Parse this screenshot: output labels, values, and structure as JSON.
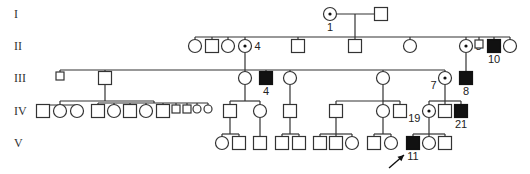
{
  "generations": [
    "I",
    "II",
    "III",
    "IV",
    "V"
  ],
  "gen_y": [
    14,
    46,
    78,
    111,
    143
  ],
  "size": 13,
  "small_size": 8,
  "individuals": [
    {
      "id": "I-1",
      "gen": 0,
      "x": 330,
      "sex": "F",
      "status": "carrier",
      "label": "1",
      "label_pos": "below"
    },
    {
      "id": "I-2",
      "gen": 0,
      "x": 381,
      "sex": "M",
      "status": "normal"
    },
    {
      "id": "II-a",
      "gen": 1,
      "x": 195,
      "sex": "F",
      "status": "normal"
    },
    {
      "id": "II-b",
      "gen": 1,
      "x": 212,
      "sex": "M",
      "status": "normal"
    },
    {
      "id": "II-c",
      "gen": 1,
      "x": 228,
      "sex": "F",
      "status": "normal"
    },
    {
      "id": "II-4",
      "gen": 1,
      "x": 245,
      "sex": "F",
      "status": "carrier",
      "label": "4",
      "label_pos": "right"
    },
    {
      "id": "II-e",
      "gen": 1,
      "x": 298,
      "sex": "M",
      "status": "normal"
    },
    {
      "id": "II-f",
      "gen": 1,
      "x": 355,
      "sex": "M",
      "status": "normal"
    },
    {
      "id": "II-g",
      "gen": 1,
      "x": 410,
      "sex": "F",
      "status": "normal"
    },
    {
      "id": "II-8",
      "gen": 1,
      "x": 466,
      "sex": "F",
      "status": "carrier",
      "label": "8",
      "label_pos": "right"
    },
    {
      "id": "II-i",
      "gen": 1,
      "x": 479,
      "sex": "M",
      "status": "normal",
      "small": true
    },
    {
      "id": "II-10",
      "gen": 1,
      "x": 494,
      "sex": "M",
      "status": "affected",
      "label": "10",
      "label_pos": "below"
    },
    {
      "id": "II-k",
      "gen": 1,
      "x": 510,
      "sex": "F",
      "status": "normal"
    },
    {
      "id": "III-a",
      "gen": 2,
      "x": 60,
      "sex": "M",
      "status": "normal",
      "small": true
    },
    {
      "id": "III-b",
      "gen": 2,
      "x": 105,
      "sex": "M",
      "status": "normal"
    },
    {
      "id": "III-c",
      "gen": 2,
      "x": 245,
      "sex": "F",
      "status": "normal"
    },
    {
      "id": "III-4",
      "gen": 2,
      "x": 266,
      "sex": "M",
      "status": "affected",
      "label": "4",
      "label_pos": "below"
    },
    {
      "id": "III-e",
      "gen": 2,
      "x": 290,
      "sex": "F",
      "status": "normal"
    },
    {
      "id": "III-f",
      "gen": 2,
      "x": 383,
      "sex": "F",
      "status": "normal"
    },
    {
      "id": "III-7",
      "gen": 2,
      "x": 445,
      "sex": "F",
      "status": "carrier",
      "label": "7",
      "label_pos": "left"
    },
    {
      "id": "III-8",
      "gen": 2,
      "x": 466,
      "sex": "M",
      "status": "affected",
      "label": "8",
      "label_pos": "below"
    },
    {
      "id": "IV-1",
      "gen": 3,
      "x": 43,
      "sex": "M",
      "status": "normal"
    },
    {
      "id": "IV-2",
      "gen": 3,
      "x": 60,
      "sex": "F",
      "status": "normal"
    },
    {
      "id": "IV-3",
      "gen": 3,
      "x": 77,
      "sex": "F",
      "status": "normal"
    },
    {
      "id": "IV-4",
      "gen": 3,
      "x": 98,
      "sex": "M",
      "status": "normal"
    },
    {
      "id": "IV-5",
      "gen": 3,
      "x": 114,
      "sex": "F",
      "status": "normal"
    },
    {
      "id": "IV-6",
      "gen": 3,
      "x": 130,
      "sex": "M",
      "status": "normal"
    },
    {
      "id": "IV-7",
      "gen": 3,
      "x": 146,
      "sex": "F",
      "status": "normal"
    },
    {
      "id": "IV-8",
      "gen": 3,
      "x": 163,
      "sex": "M",
      "status": "normal"
    },
    {
      "id": "IV-9",
      "gen": 3,
      "x": 176,
      "sex": "M",
      "status": "normal",
      "small": true
    },
    {
      "id": "IV-10",
      "gen": 3,
      "x": 187,
      "sex": "M",
      "status": "normal",
      "small": true
    },
    {
      "id": "IV-11",
      "gen": 3,
      "x": 197,
      "sex": "F",
      "status": "normal",
      "small": true
    },
    {
      "id": "IV-12",
      "gen": 3,
      "x": 208,
      "sex": "F",
      "status": "normal",
      "small": true
    },
    {
      "id": "IV-13",
      "gen": 3,
      "x": 230,
      "sex": "M",
      "status": "normal"
    },
    {
      "id": "IV-14",
      "gen": 3,
      "x": 260,
      "sex": "F",
      "status": "normal"
    },
    {
      "id": "IV-15",
      "gen": 3,
      "x": 290,
      "sex": "M",
      "status": "normal"
    },
    {
      "id": "IV-16",
      "gen": 3,
      "x": 336,
      "sex": "M",
      "status": "normal"
    },
    {
      "id": "IV-17",
      "gen": 3,
      "x": 383,
      "sex": "F",
      "status": "normal"
    },
    {
      "id": "IV-18",
      "gen": 3,
      "x": 400,
      "sex": "M",
      "status": "normal"
    },
    {
      "id": "IV-19",
      "gen": 3,
      "x": 429,
      "sex": "F",
      "status": "carrier",
      "label": "19",
      "label_pos": "left"
    },
    {
      "id": "IV-20",
      "gen": 3,
      "x": 445,
      "sex": "M",
      "status": "normal"
    },
    {
      "id": "IV-21",
      "gen": 3,
      "x": 461,
      "sex": "M",
      "status": "affected",
      "label": "21",
      "label_pos": "below"
    },
    {
      "id": "V-1",
      "gen": 4,
      "x": 222,
      "sex": "F",
      "status": "normal"
    },
    {
      "id": "V-2",
      "gen": 4,
      "x": 239,
      "sex": "M",
      "status": "normal"
    },
    {
      "id": "V-3",
      "gen": 4,
      "x": 260,
      "sex": "M",
      "status": "normal"
    },
    {
      "id": "V-4",
      "gen": 4,
      "x": 282,
      "sex": "M",
      "status": "normal"
    },
    {
      "id": "V-5",
      "gen": 4,
      "x": 299,
      "sex": "M",
      "status": "normal"
    },
    {
      "id": "V-6",
      "gen": 4,
      "x": 320,
      "sex": "M",
      "status": "normal"
    },
    {
      "id": "V-7",
      "gen": 4,
      "x": 336,
      "sex": "M",
      "status": "normal"
    },
    {
      "id": "V-8",
      "gen": 4,
      "x": 352,
      "sex": "F",
      "status": "normal"
    },
    {
      "id": "V-9",
      "gen": 4,
      "x": 374,
      "sex": "M",
      "status": "normal"
    },
    {
      "id": "V-10",
      "gen": 4,
      "x": 391,
      "sex": "F",
      "status": "normal"
    },
    {
      "id": "V-11",
      "gen": 4,
      "x": 413,
      "sex": "M",
      "status": "affected",
      "label": "11",
      "label_pos": "below",
      "proband": true
    },
    {
      "id": "V-12",
      "gen": 4,
      "x": 429,
      "sex": "F",
      "status": "normal"
    },
    {
      "id": "V-13",
      "gen": 4,
      "x": 445,
      "sex": "M",
      "status": "normal"
    }
  ],
  "lines": [
    [
      337,
      14,
      374,
      14
    ],
    [
      355,
      14,
      355,
      37
    ],
    [
      195,
      37,
      510,
      37
    ],
    [
      195,
      37,
      195,
      40
    ],
    [
      212,
      37,
      212,
      40
    ],
    [
      228,
      37,
      228,
      40
    ],
    [
      245,
      37,
      245,
      40
    ],
    [
      298,
      37,
      298,
      40
    ],
    [
      355,
      37,
      355,
      40
    ],
    [
      410,
      37,
      410,
      40
    ],
    [
      466,
      37,
      466,
      40
    ],
    [
      479,
      37,
      479,
      43
    ],
    [
      494,
      37,
      494,
      40
    ],
    [
      510,
      37,
      510,
      40
    ],
    [
      245,
      53,
      245,
      70
    ],
    [
      60,
      70,
      445,
      70
    ],
    [
      60,
      70,
      60,
      74
    ],
    [
      105,
      70,
      105,
      72
    ],
    [
      245,
      70,
      245,
      72
    ],
    [
      266,
      70,
      266,
      72
    ],
    [
      290,
      70,
      290,
      72
    ],
    [
      383,
      70,
      383,
      72
    ],
    [
      445,
      70,
      445,
      72
    ],
    [
      466,
      53,
      466,
      72
    ],
    [
      105,
      85,
      105,
      101
    ],
    [
      60,
      101,
      154,
      101
    ],
    [
      60,
      101,
      60,
      105
    ],
    [
      43,
      105,
      77,
      105
    ],
    [
      43,
      105,
      43,
      105
    ],
    [
      77,
      105,
      77,
      105
    ],
    [
      154,
      101,
      154,
      103
    ],
    [
      98,
      103,
      208,
      103
    ],
    [
      98,
      103,
      98,
      105
    ],
    [
      114,
      103,
      114,
      105
    ],
    [
      130,
      103,
      130,
      105
    ],
    [
      146,
      103,
      146,
      105
    ],
    [
      163,
      103,
      163,
      105
    ],
    [
      176,
      103,
      176,
      107
    ],
    [
      187,
      103,
      187,
      107
    ],
    [
      197,
      103,
      197,
      107
    ],
    [
      208,
      103,
      208,
      107
    ],
    [
      245,
      85,
      245,
      101
    ],
    [
      230,
      101,
      260,
      101
    ],
    [
      230,
      101,
      230,
      105
    ],
    [
      260,
      101,
      260,
      105
    ],
    [
      290,
      85,
      290,
      105
    ],
    [
      383,
      85,
      383,
      101
    ],
    [
      336,
      101,
      383,
      101
    ],
    [
      336,
      101,
      336,
      105
    ],
    [
      383,
      101,
      383,
      105
    ],
    [
      400,
      101,
      400,
      105
    ],
    [
      383,
      101,
      400,
      101
    ],
    [
      445,
      85,
      445,
      101
    ],
    [
      429,
      101,
      461,
      101
    ],
    [
      429,
      101,
      429,
      105
    ],
    [
      445,
      101,
      445,
      105
    ],
    [
      461,
      101,
      461,
      105
    ],
    [
      230,
      118,
      230,
      134
    ],
    [
      222,
      134,
      239,
      134
    ],
    [
      222,
      134,
      222,
      137
    ],
    [
      239,
      134,
      239,
      137
    ],
    [
      260,
      118,
      260,
      137
    ],
    [
      290,
      118,
      290,
      134
    ],
    [
      282,
      134,
      299,
      134
    ],
    [
      282,
      134,
      282,
      137
    ],
    [
      299,
      134,
      299,
      137
    ],
    [
      336,
      118,
      336,
      134
    ],
    [
      320,
      134,
      352,
      134
    ],
    [
      320,
      134,
      320,
      137
    ],
    [
      336,
      134,
      336,
      137
    ],
    [
      352,
      134,
      352,
      137
    ],
    [
      383,
      118,
      383,
      134
    ],
    [
      374,
      134,
      391,
      134
    ],
    [
      374,
      134,
      374,
      137
    ],
    [
      391,
      134,
      391,
      137
    ],
    [
      429,
      118,
      429,
      134
    ],
    [
      413,
      134,
      445,
      134
    ],
    [
      413,
      134,
      413,
      137
    ],
    [
      429,
      134,
      429,
      137
    ],
    [
      445,
      134,
      445,
      137
    ]
  ],
  "proband_arrow": {
    "x1": 389,
    "y1": 168,
    "x2": 404,
    "y2": 155
  }
}
